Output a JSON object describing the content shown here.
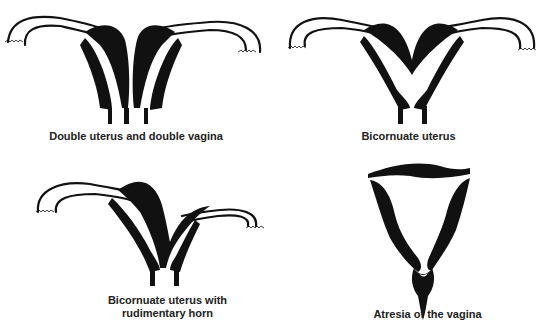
{
  "figure": {
    "panels": [
      {
        "id": "double-uterus-double-vagina",
        "caption": "Double uterus and double vagina"
      },
      {
        "id": "bicornuate-uterus",
        "caption": "Bicornuate uterus"
      },
      {
        "id": "bicornuate-uterus-rudimentary-horn",
        "caption_line1": "Bicornuate uterus with",
        "caption_line2": "rudimentary horn"
      },
      {
        "id": "atresia-of-vagina",
        "caption": "Atresia of the vagina"
      }
    ],
    "colors": {
      "ink": "#111111",
      "background": "#ffffff",
      "caption": "#222222"
    }
  }
}
